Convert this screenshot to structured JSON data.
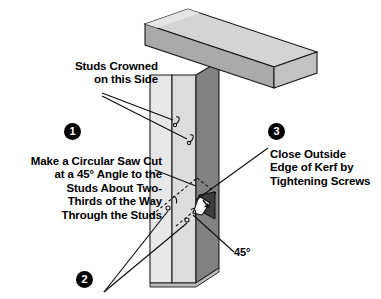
{
  "figure": {
    "width": 381,
    "height": 299,
    "background": "#ffffff"
  },
  "callouts": [
    {
      "id": "crowned",
      "text": "Studs Crowned\non this Side",
      "align": "right",
      "marker": null
    },
    {
      "id": "step1",
      "number": "1",
      "text": "Make a Circular Saw Cut\nat a 45° Angle to the\nStuds About Two-\nThirds of the Way\nThrough the Studs",
      "align": "right"
    },
    {
      "id": "step2",
      "number": "2",
      "text": "",
      "align": "left"
    },
    {
      "id": "step3",
      "number": "3",
      "text": "Close Outside\nEdge of Kerf by\nTightening Screws",
      "align": "left"
    }
  ],
  "markers": {
    "one": "1",
    "two": "2",
    "three": "3"
  },
  "annotations": {
    "angle": "45°"
  },
  "colors": {
    "ink": "#000000",
    "paper": "#ffffff",
    "beam_top": "#d2d2d2",
    "beam_front": "#a9a9a9",
    "beam_end": "#bdbdbd",
    "stud_light": "#e4e4e4",
    "stud_mid": "#d8d8d8",
    "stud_dark": "#808080",
    "kerf_dark": "#3a3a3a",
    "outline": "#1a1a1a"
  },
  "parts": {
    "beam": "horizontal-beam",
    "stud_front_left": "stud-face-left",
    "stud_front_right": "stud-face-right",
    "stud_side": "stud-side-dark",
    "kerf": "saw-kerf-wedge",
    "screws": [
      "screw-upper",
      "screw-lower",
      "screw-kerf-upper",
      "screw-kerf-lower"
    ]
  }
}
